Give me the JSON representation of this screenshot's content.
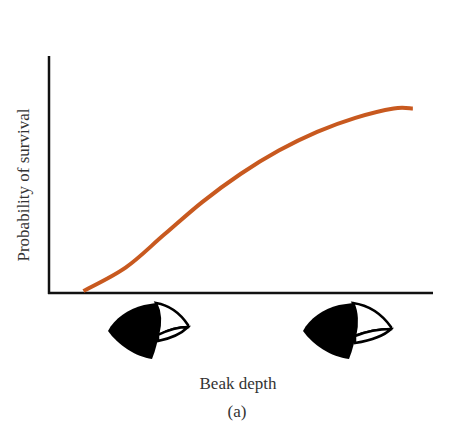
{
  "chart_data": {
    "type": "line",
    "title": "",
    "xlabel": "Beak depth",
    "ylabel": "Probability of survival",
    "caption": "(a)",
    "grid": false,
    "legend": null,
    "x_ticks": [],
    "y_ticks": [],
    "x_tick_icons": [
      "small-beak-finch-head-icon",
      "large-beak-finch-head-icon"
    ],
    "xlim": [
      0,
      1
    ],
    "ylim": [
      0,
      1
    ],
    "series": [
      {
        "name": "survival curve",
        "color": "#c8591f",
        "x": [
          0.09,
          0.2,
          0.3,
          0.4,
          0.5,
          0.6,
          0.7,
          0.8,
          0.9,
          0.95
        ],
        "y": [
          0.0,
          0.1,
          0.24,
          0.38,
          0.5,
          0.6,
          0.68,
          0.74,
          0.78,
          0.78
        ]
      }
    ]
  },
  "colors": {
    "axis": "#111111",
    "curve": "#c8591f",
    "text": "#333333"
  }
}
